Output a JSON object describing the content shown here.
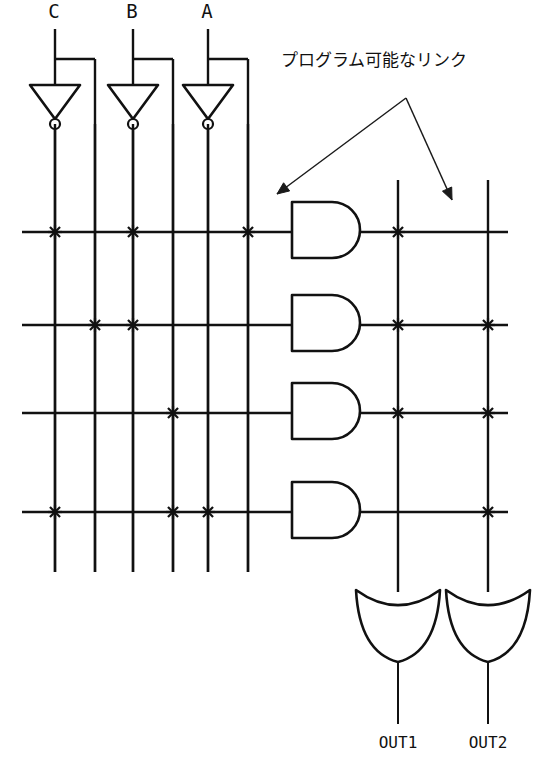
{
  "figure": {
    "kind": "pla-schematic",
    "background_color": "#ffffff",
    "line_color": "#111111"
  },
  "annotation": {
    "text": "プログラム可能なリンク",
    "text_x": 281,
    "text_y": 66,
    "apex_x": 406,
    "apex_y": 98,
    "arrow_left_x": 277,
    "arrow_left_y": 194,
    "arrow_right_x": 452,
    "arrow_right_y": 200
  },
  "inputs": [
    {
      "label": "C",
      "label_x": 54,
      "label_y": 18,
      "stem_x": 55,
      "branch_x": 95,
      "inv_cx": 55,
      "true_line_x": 95,
      "comp_line_x": 55
    },
    {
      "label": "B",
      "label_x": 132,
      "label_y": 18,
      "stem_x": 133,
      "branch_x": 173,
      "inv_cx": 133,
      "true_line_x": 173,
      "comp_line_x": 133
    },
    {
      "label": "A",
      "label_x": 207,
      "label_y": 18,
      "stem_x": 208,
      "branch_x": 248,
      "inv_cx": 208,
      "true_line_x": 248,
      "comp_line_x": 208
    }
  ],
  "inverter_geometry": {
    "top_y": 85,
    "bottom_y": 119,
    "half_width": 25,
    "bubble_cy": 124,
    "bubble_r": 5,
    "stem_top_y": 29,
    "branch_y": 59,
    "out_bottom_y": 572
  },
  "and_plane": {
    "column_xs": [
      55,
      95,
      133,
      173,
      208,
      248
    ],
    "column_names": [
      "C-comp",
      "C-true",
      "B-comp",
      "B-true",
      "A-comp",
      "A-true"
    ],
    "column_top_y": 30,
    "column_bottom_y": 572,
    "row_left_x": 22,
    "rows": [
      {
        "y": 232,
        "links": [
          55,
          133,
          248
        ]
      },
      {
        "y": 325,
        "links": [
          95,
          133
        ]
      },
      {
        "y": 413,
        "links": [
          173
        ]
      },
      {
        "y": 512,
        "links": [
          55,
          173,
          208
        ]
      }
    ]
  },
  "and_gates": [
    {
      "x": 292,
      "y": 202,
      "w": 68,
      "h": 56,
      "row_y": 232
    },
    {
      "x": 292,
      "y": 295,
      "w": 68,
      "h": 56,
      "row_y": 325
    },
    {
      "x": 292,
      "y": 383,
      "w": 68,
      "h": 56,
      "row_y": 413
    },
    {
      "x": 292,
      "y": 482,
      "w": 68,
      "h": 56,
      "row_y": 512
    }
  ],
  "or_plane": {
    "column_xs": [
      398,
      488
    ],
    "column_names": [
      "OUT1-sum",
      "OUT2-sum"
    ],
    "column_top_y": 180,
    "column_bottom_y": 592,
    "row_right_x": 508,
    "rows": [
      {
        "y": 232,
        "links": [
          398
        ]
      },
      {
        "y": 325,
        "links": [
          398,
          488
        ]
      },
      {
        "y": 413,
        "links": [
          398,
          488
        ]
      },
      {
        "y": 512,
        "links": [
          488
        ]
      }
    ]
  },
  "or_gates": [
    {
      "label": "OUT1",
      "cx": 398,
      "top_y": 590,
      "bottom_y": 662,
      "half_width": 42,
      "dish_depth": 16,
      "out_bottom_y": 724,
      "label_x": 398,
      "label_y": 748
    },
    {
      "label": "OUT2",
      "cx": 488,
      "top_y": 590,
      "bottom_y": 662,
      "half_width": 42,
      "dish_depth": 16,
      "out_bottom_y": 724,
      "label_x": 488,
      "label_y": 748
    }
  ],
  "link_marker": {
    "arm": 7,
    "kind": "x-cross"
  }
}
